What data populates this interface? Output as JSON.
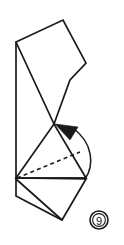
{
  "figure": {
    "kind": "origami-fold-step-diagram",
    "step_badge": {
      "label": "9",
      "shape": "double-circle",
      "center_x": 99,
      "center_y": 220,
      "outer_radius": 9,
      "inner_radius": 6.4
    },
    "canvas": {
      "width": 124,
      "height": 245,
      "background": "#ffffff"
    },
    "colors": {
      "line": "#1a1a1a",
      "face": "#ffffff",
      "background": "#ffffff"
    }
  },
  "shapes": {
    "top_panel": {
      "name": "upper-flap-polygon",
      "points": "16,42 63,20 86,63 70,80 54,124 16,42"
    },
    "left_spine": {
      "name": "left-vertical-edge",
      "points": "16,42 16,178"
    },
    "main_triangle": {
      "name": "lower-triangle-face",
      "points": "16,178 54,124 86,178"
    },
    "crease_line": {
      "name": "hidden-crease-dashed",
      "points": "17,178 80,152"
    },
    "bottom_flap": {
      "name": "bottom-flap-polygon",
      "points": "16,178 16,196 62,220 86,179"
    },
    "bottom_inner_crease": {
      "name": "bottom-inner-fold-line",
      "points": "16,178 86,178"
    },
    "bottom_diagonal": {
      "name": "bottom-flap-diagonal",
      "points": "16,179 62,220"
    }
  },
  "arrow": {
    "name": "fold-direction-arrow",
    "arc_path": "M 85,179 C 94,166 94,144 73,128",
    "head_points": "55,124 78,127 70,140",
    "description": "curved arrow indicating fold toward apex"
  }
}
